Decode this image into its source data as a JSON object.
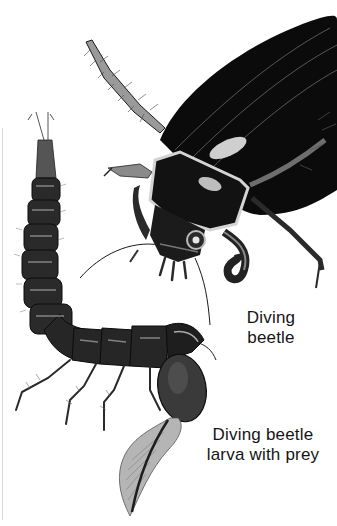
{
  "illustration": {
    "subjects": [
      {
        "id": "beetle",
        "description": "adult diving beetle, black glossy body, dark ink illustration"
      },
      {
        "id": "larva",
        "description": "segmented diving beetle larva curling around prey (tadpole)"
      }
    ]
  },
  "labels": {
    "beetle_line1": "Diving",
    "beetle_line2": "beetle",
    "larva_line1": "Diving beetle",
    "larva_line2": "larva with prey"
  },
  "colors": {
    "ink": "#0d0d0d",
    "highlight": "#bdbdbd",
    "midtone": "#5a5a5a",
    "background": "#ffffff",
    "prey": "#9a9a9a"
  }
}
